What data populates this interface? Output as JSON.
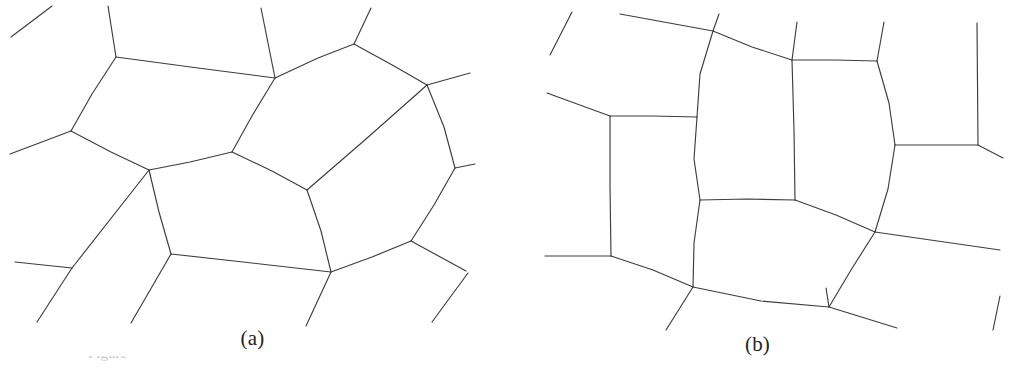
{
  "figure": {
    "background_color": "#ffffff",
    "line_color": "#3d3d3d",
    "width": 1010,
    "height": 370,
    "caption_sliver_text": "Figure"
  },
  "panels": [
    {
      "id": "a",
      "label": "(a)",
      "label_letter": "a",
      "description": "Irregular two-dimensional foam: disordered soap-froth cell network with curved cell walls meeting three at a time",
      "cell_count": 4,
      "vertices": [
        {
          "name": "v-top-left",
          "x": 116,
          "y": 57
        },
        {
          "name": "v-left",
          "x": 71,
          "y": 131
        },
        {
          "name": "v-top-mid",
          "x": 275,
          "y": 78
        },
        {
          "name": "v-top-right",
          "x": 354,
          "y": 44
        },
        {
          "name": "v-right-upper",
          "x": 427,
          "y": 85
        },
        {
          "name": "v-center",
          "x": 232,
          "y": 152
        },
        {
          "name": "v-mid-left",
          "x": 149,
          "y": 170
        },
        {
          "name": "v-center-low",
          "x": 307,
          "y": 190
        },
        {
          "name": "v-right",
          "x": 455,
          "y": 168
        },
        {
          "name": "v-bottom-left",
          "x": 171,
          "y": 254
        },
        {
          "name": "v-bottom-mid",
          "x": 331,
          "y": 272
        },
        {
          "name": "v-right-lower",
          "x": 411,
          "y": 241
        }
      ],
      "edges": [
        {
          "name": "edge-topleft-topmid",
          "path": "M 116 57 L 198 68 L 275 78"
        },
        {
          "name": "edge-topmid-topright",
          "path": "M 275 78 L 318 58 L 354 44"
        },
        {
          "name": "edge-topright-rightupper",
          "path": "M 354 44 L 394 66 L 427 85"
        },
        {
          "name": "edge-topleft-left",
          "path": "M 116 57 L 92 94 L 71 131"
        },
        {
          "name": "edge-left-midleft",
          "path": "M 71 131 L 111 152 L 149 170"
        },
        {
          "name": "edge-topmid-center",
          "path": "M 275 78 L 252 116 L 232 152"
        },
        {
          "name": "edge-center-midleft",
          "path": "M 232 152 L 190 162 L 149 170"
        },
        {
          "name": "edge-center-centerlow",
          "path": "M 232 152 L 272 171 L 307 190"
        },
        {
          "name": "edge-rightupper-centerlow",
          "path": "M 427 85 L 366 139 L 307 190"
        },
        {
          "name": "edge-rightupper-right",
          "path": "M 427 85 L 444 127 L 455 168"
        },
        {
          "name": "edge-midleft-bottomleft",
          "path": "M 149 170 L 159 212 L 171 254"
        },
        {
          "name": "edge-bottomleft-bottommid",
          "path": "M 171 254 L 252 263 L 331 272"
        },
        {
          "name": "edge-centerlow-bottommid",
          "path": "M 307 190 L 321 231 L 331 272"
        },
        {
          "name": "edge-bottommid-rightlower",
          "path": "M 331 272 L 372 257 L 411 241"
        },
        {
          "name": "edge-right-rightlower",
          "path": "M 455 168 L 434 205 L 411 241"
        }
      ],
      "stubs": [
        {
          "name": "stub-top-left-corner",
          "path": "M 11 37 L 52 6"
        },
        {
          "name": "stub-from-topleft-up",
          "path": "M 116 57 L 108 6"
        },
        {
          "name": "stub-from-topmid-up",
          "path": "M 275 78 L 261 8"
        },
        {
          "name": "stub-from-topright-up",
          "path": "M 354 44 L 371 8"
        },
        {
          "name": "stub-from-left-out",
          "path": "M 71 131 L 10 154"
        },
        {
          "name": "stub-from-right-out",
          "path": "M 455 168 L 475 164"
        },
        {
          "name": "stub-from-rightupper-out",
          "path": "M 427 85 L 470 73"
        },
        {
          "name": "stub-from-midleft-down",
          "path": "M 149 170 L 72 268"
        },
        {
          "name": "stub-lower-left-branch-in",
          "path": "M 72 268 L 15 262"
        },
        {
          "name": "stub-lower-left-branch-down",
          "path": "M 72 268 L 37 322"
        },
        {
          "name": "stub-from-bottomleft-down",
          "path": "M 171 254 L 131 323"
        },
        {
          "name": "stub-from-bottommid-down",
          "path": "M 331 272 L 306 326"
        },
        {
          "name": "stub-from-rightlower-out",
          "path": "M 411 241 L 466 271"
        },
        {
          "name": "stub-bottom-right-corner",
          "path": "M 432 322 L 468 273"
        }
      ]
    },
    {
      "id": "b",
      "label": "(b)",
      "label_letter": "b",
      "description": "Relaxed / more ordered two-dimensional foam: cells arranged in a quasi-rectangular lattice with walls meeting near 120 degrees",
      "cell_count": 4,
      "vertices": [
        {
          "name": "v-top-mid-left",
          "x": 713,
          "y": 31
        },
        {
          "name": "v-top-right",
          "x": 877,
          "y": 61
        },
        {
          "name": "v-upper-right",
          "x": 792,
          "y": 60
        },
        {
          "name": "v-mid-left",
          "x": 610,
          "y": 116
        },
        {
          "name": "v-mid-center",
          "x": 697,
          "y": 117
        },
        {
          "name": "v-right",
          "x": 895,
          "y": 145
        },
        {
          "name": "v-center-low-left",
          "x": 700,
          "y": 200
        },
        {
          "name": "v-center-low-right",
          "x": 795,
          "y": 200
        },
        {
          "name": "v-low-left",
          "x": 611,
          "y": 256
        },
        {
          "name": "v-low-right",
          "x": 875,
          "y": 232
        },
        {
          "name": "v-bottom-left",
          "x": 693,
          "y": 287
        },
        {
          "name": "v-bottom-right",
          "x": 829,
          "y": 307
        }
      ],
      "edges": [
        {
          "name": "edge-topmidleft-upperright",
          "path": "M 713 31 L 752 47 L 792 60"
        },
        {
          "name": "edge-upperright-topright",
          "path": "M 792 60 L 835 60 L 877 61"
        },
        {
          "name": "edge-topmidleft-midcenter",
          "path": "M 713 31 L 700 74 L 697 117"
        },
        {
          "name": "edge-midleft-midcenter",
          "path": "M 610 116 L 653 116 L 697 117"
        },
        {
          "name": "edge-midcenter-centerlowleft",
          "path": "M 697 117 L 694 159 L 700 200"
        },
        {
          "name": "edge-upperright-centerlowright",
          "path": "M 792 60 L 794 130 L 795 200"
        },
        {
          "name": "edge-topright-right",
          "path": "M 877 61 L 889 103 L 895 145"
        },
        {
          "name": "edge-centerlowleft-centerlowright",
          "path": "M 700 200 L 747 199 L 795 200"
        },
        {
          "name": "edge-right-lowright",
          "path": "M 895 145 L 888 189 L 875 232"
        },
        {
          "name": "edge-centerlowright-lowright",
          "path": "M 795 200 L 836 215 L 875 232"
        },
        {
          "name": "edge-midleft-lowleft",
          "path": "M 610 116 L 610 186 L 611 256"
        },
        {
          "name": "edge-centerlowleft-bottomleft",
          "path": "M 700 200 L 694 243 L 693 287"
        },
        {
          "name": "edge-lowleft-bottomleft",
          "path": "M 611 256 L 653 270 L 693 287"
        },
        {
          "name": "edge-bottomleft-bottomright",
          "path": "M 693 287 L 761 301 L 829 307"
        },
        {
          "name": "edge-lowright-bottomright",
          "path": "M 875 232 L 851 270 L 829 307"
        }
      ],
      "stubs": [
        {
          "name": "stub-top-left-corner",
          "path": "M 550 55 L 572 12"
        },
        {
          "name": "stub-from-topmidleft-left",
          "path": "M 713 31 L 620 14"
        },
        {
          "name": "stub-from-topmidleft-up",
          "path": "M 713 31 L 719 14"
        },
        {
          "name": "stub-from-topright-up",
          "path": "M 877 61 L 884 22"
        },
        {
          "name": "stub-from-upperright-up",
          "path": "M 792 60 L 797 22"
        },
        {
          "name": "stub-from-midleft-out",
          "path": "M 610 116 L 547 93"
        },
        {
          "name": "stub-from-right-out",
          "path": "M 895 145 L 978 145"
        },
        {
          "name": "stub-right-corner-up",
          "path": "M 978 145 L 977 23"
        },
        {
          "name": "stub-right-corner-down",
          "path": "M 978 145 L 1003 158"
        },
        {
          "name": "stub-from-lowleft-out",
          "path": "M 611 256 L 545 256"
        },
        {
          "name": "stub-from-bottomleft-down",
          "path": "M 693 287 L 666 330"
        },
        {
          "name": "stub-from-lowright-out",
          "path": "M 875 232 L 1000 250"
        },
        {
          "name": "stub-from-bottomright-up",
          "path": "M 829 307 L 826 288"
        },
        {
          "name": "stub-from-bottomright-out",
          "path": "M 829 307 L 897 328"
        },
        {
          "name": "stub-bottom-right-corner",
          "path": "M 1000 296 L 993 330"
        }
      ]
    }
  ]
}
